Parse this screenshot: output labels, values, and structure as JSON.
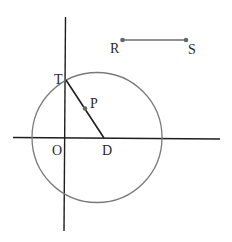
{
  "diagram": {
    "colors": {
      "axis": "#1e1e1e",
      "circle": "#7a7a7a",
      "segment_td": "#1e1e1e",
      "segment_rs": "#6e6e6e",
      "point": "#666666",
      "label": "#2a2a2a"
    },
    "points": {
      "O": {
        "label": "O"
      },
      "T": {
        "label": "T"
      },
      "P": {
        "label": "P"
      },
      "D": {
        "label": "D"
      },
      "R": {
        "label": "R"
      },
      "S": {
        "label": "S"
      }
    },
    "shapes": {
      "circle": "circle centered on horizontal axis passing through T",
      "segments": [
        "TD",
        "RS"
      ],
      "axes": [
        "horizontal line through O and D",
        "vertical line through O and T"
      ]
    }
  }
}
